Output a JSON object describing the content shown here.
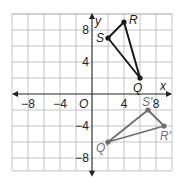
{
  "figure": {
    "type": "coordinate-plane",
    "axes": {
      "x_label": "x",
      "y_label": "y",
      "origin_label": "O",
      "x_ticks": [
        {
          "value": -8,
          "label": "−8"
        },
        {
          "value": -4,
          "label": "−4"
        },
        {
          "value": 4,
          "label": "4"
        },
        {
          "value": 8,
          "label": "8"
        }
      ],
      "y_ticks": [
        {
          "value": 8,
          "label": "8"
        },
        {
          "value": 4,
          "label": "4"
        },
        {
          "value": -4,
          "label": "−4"
        },
        {
          "value": -8,
          "label": "−8"
        }
      ],
      "grid_step": 2,
      "x_range": [
        -10,
        10
      ],
      "y_range": [
        -9.6,
        10
      ]
    },
    "preimage": {
      "name": "triangle-QRS",
      "color": "#1a1a1a",
      "vertices": [
        {
          "label": "Q",
          "x": 6,
          "y": 2
        },
        {
          "label": "R",
          "x": 4,
          "y": 9
        },
        {
          "label": "S",
          "x": 2,
          "y": 7
        }
      ]
    },
    "image": {
      "name": "triangle-QRS-prime",
      "color": "#6e6e6e",
      "vertices": [
        {
          "label": "Q'",
          "x": 2,
          "y": -6
        },
        {
          "label": "R'",
          "x": 9,
          "y": -4
        },
        {
          "label": "S'",
          "x": 7,
          "y": -2
        }
      ]
    },
    "colors": {
      "grid": "#b8b8b8",
      "axis": "#222222",
      "background": "#ffffff"
    }
  }
}
